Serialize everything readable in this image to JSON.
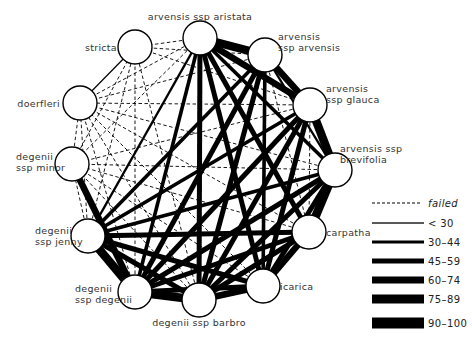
{
  "diagram": {
    "title": "",
    "node_radius": 17,
    "nodes": [
      {
        "id": "aristata",
        "x": 200,
        "y": 38,
        "label": [
          "arvensis ssp aristata"
        ],
        "lx": 200,
        "ly": 20,
        "anchor": "middle"
      },
      {
        "id": "arvensis",
        "x": 265,
        "y": 55,
        "label": [
          "arvensis",
          "ssp arvensis"
        ],
        "lx": 278,
        "ly": 40,
        "anchor": "start"
      },
      {
        "id": "glauca",
        "x": 310,
        "y": 105,
        "label": [
          "arvensis",
          "ssp glauca"
        ],
        "lx": 326,
        "ly": 92,
        "anchor": "start"
      },
      {
        "id": "brevifolia",
        "x": 335,
        "y": 170,
        "label": [
          "arvensis ssp",
          "brevifolia"
        ],
        "lx": 340,
        "ly": 152,
        "anchor": "start"
      },
      {
        "id": "carpatha",
        "x": 309,
        "y": 232,
        "label": [
          "carpatha"
        ],
        "lx": 326,
        "ly": 236,
        "anchor": "start"
      },
      {
        "id": "icarica",
        "x": 263,
        "y": 286,
        "label": [
          "icarica"
        ],
        "lx": 280,
        "ly": 290,
        "anchor": "start"
      },
      {
        "id": "barbro",
        "x": 199,
        "y": 300,
        "label": [
          "degenii ssp barbro"
        ],
        "lx": 199,
        "ly": 326,
        "anchor": "middle"
      },
      {
        "id": "degenii",
        "x": 135,
        "y": 292,
        "label": [
          "degenii",
          "ssp degenii"
        ],
        "lx": 75,
        "ly": 292,
        "anchor": "start"
      },
      {
        "id": "jenny",
        "x": 88,
        "y": 236,
        "label": [
          "degenii",
          "ssp jenny"
        ],
        "lx": 35,
        "ly": 234,
        "anchor": "start"
      },
      {
        "id": "minor",
        "x": 72,
        "y": 164,
        "label": [
          "degenii",
          "ssp minor"
        ],
        "lx": 16,
        "ly": 160,
        "anchor": "start"
      },
      {
        "id": "doerfleri",
        "x": 80,
        "y": 103,
        "label": [
          "doerfleri"
        ],
        "lx": 60,
        "ly": 107,
        "anchor": "end"
      },
      {
        "id": "stricta",
        "x": 135,
        "y": 47,
        "label": [
          "stricta"
        ],
        "lx": 117,
        "ly": 51,
        "anchor": "end"
      }
    ],
    "edges": [
      [
        "aristata",
        "arvensis",
        6
      ],
      [
        "aristata",
        "glauca",
        5
      ],
      [
        "aristata",
        "brevifolia",
        3
      ],
      [
        "aristata",
        "carpatha",
        4
      ],
      [
        "aristata",
        "icarica",
        4
      ],
      [
        "aristata",
        "barbro",
        4
      ],
      [
        "aristata",
        "degenii",
        3
      ],
      [
        "aristata",
        "jenny",
        2
      ],
      [
        "aristata",
        "stricta",
        0
      ],
      [
        "aristata",
        "doerfleri",
        0
      ],
      [
        "aristata",
        "minor",
        0
      ],
      [
        "arvensis",
        "glauca",
        5
      ],
      [
        "arvensis",
        "brevifolia",
        2
      ],
      [
        "arvensis",
        "carpatha",
        0
      ],
      [
        "arvensis",
        "icarica",
        3
      ],
      [
        "arvensis",
        "barbro",
        4
      ],
      [
        "arvensis",
        "degenii",
        4
      ],
      [
        "arvensis",
        "jenny",
        3
      ],
      [
        "arvensis",
        "doerfleri",
        0
      ],
      [
        "arvensis",
        "stricta",
        0
      ],
      [
        "glauca",
        "brevifolia",
        6
      ],
      [
        "glauca",
        "carpatha",
        0
      ],
      [
        "glauca",
        "icarica",
        4
      ],
      [
        "glauca",
        "barbro",
        4
      ],
      [
        "glauca",
        "degenii",
        4
      ],
      [
        "glauca",
        "jenny",
        3
      ],
      [
        "glauca",
        "doerfleri",
        0
      ],
      [
        "glauca",
        "minor",
        0
      ],
      [
        "glauca",
        "stricta",
        0
      ],
      [
        "brevifolia",
        "carpatha",
        6
      ],
      [
        "brevifolia",
        "icarica",
        4
      ],
      [
        "brevifolia",
        "barbro",
        4
      ],
      [
        "brevifolia",
        "degenii",
        4
      ],
      [
        "brevifolia",
        "jenny",
        3
      ],
      [
        "brevifolia",
        "minor",
        0
      ],
      [
        "brevifolia",
        "doerfleri",
        0
      ],
      [
        "carpatha",
        "icarica",
        5
      ],
      [
        "carpatha",
        "barbro",
        4
      ],
      [
        "carpatha",
        "degenii",
        4
      ],
      [
        "carpatha",
        "jenny",
        4
      ],
      [
        "carpatha",
        "minor",
        0
      ],
      [
        "carpatha",
        "doerfleri",
        0
      ],
      [
        "icarica",
        "barbro",
        5
      ],
      [
        "icarica",
        "degenii",
        4
      ],
      [
        "icarica",
        "jenny",
        4
      ],
      [
        "icarica",
        "minor",
        0
      ],
      [
        "icarica",
        "doerfleri",
        0
      ],
      [
        "barbro",
        "degenii",
        6
      ],
      [
        "barbro",
        "jenny",
        4
      ],
      [
        "barbro",
        "minor",
        0
      ],
      [
        "barbro",
        "doerfleri",
        0
      ],
      [
        "barbro",
        "stricta",
        0
      ],
      [
        "degenii",
        "jenny",
        6
      ],
      [
        "degenii",
        "minor",
        5
      ],
      [
        "degenii",
        "doerfleri",
        0
      ],
      [
        "degenii",
        "stricta",
        0
      ],
      [
        "jenny",
        "minor",
        0
      ],
      [
        "jenny",
        "doerfleri",
        0
      ],
      [
        "jenny",
        "stricta",
        0
      ],
      [
        "minor",
        "doerfleri",
        0
      ],
      [
        "minor",
        "stricta",
        0
      ],
      [
        "doerfleri",
        "stricta",
        1
      ]
    ],
    "edge_widths": {
      "0": 0.9,
      "1": 1.2,
      "2": 2.4,
      "3": 3.6,
      "4": 5,
      "5": 6.5,
      "6": 8.5
    }
  },
  "legend": {
    "items": [
      {
        "label": "failed",
        "class": 0,
        "style": "dashed",
        "height": 1
      },
      {
        "label": "< 30",
        "class": 1,
        "style": "solid",
        "height": 1.3
      },
      {
        "label": "30–44",
        "class": 2,
        "style": "solid",
        "height": 3
      },
      {
        "label": "45–59",
        "class": 3,
        "style": "solid",
        "height": 5
      },
      {
        "label": "60–74",
        "class": 4,
        "style": "solid",
        "height": 7
      },
      {
        "label": "75–89",
        "class": 5,
        "style": "solid",
        "height": 9
      },
      {
        "label": "90–100",
        "class": 6,
        "style": "solid",
        "height": 11
      }
    ]
  },
  "colors": {
    "line": "#000000",
    "node_fill": "#ffffff",
    "text": "#333333"
  }
}
